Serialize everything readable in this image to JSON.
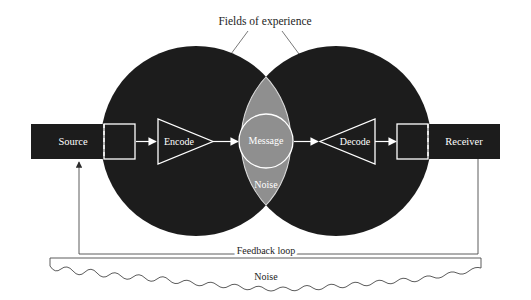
{
  "diagram": {
    "colors": {
      "background": "#ffffff",
      "field_circle": "#1c1c1c",
      "overlap_lens": "#8f8f8f",
      "message_circle": "#8f8f8f",
      "stroke_light": "#ffffff",
      "stroke_dark": "#3a3a3a",
      "text_dark": "#1d1d1d",
      "text_light": "#ffffff"
    },
    "labels": {
      "fields_of_experience": "Fields of experience",
      "source": "Source",
      "encode": "Encode",
      "message": "Message",
      "noise_center": "Noise",
      "decode": "Decode",
      "receiver": "Receiver",
      "feedback_loop": "Feedback loop",
      "noise_band": "Noise"
    },
    "elements": [
      {
        "name": "source-block",
        "label": "Source",
        "kind": "bar"
      },
      {
        "name": "encode-triangle",
        "label": "Encode",
        "kind": "triangle-right"
      },
      {
        "name": "message-circle",
        "label": "Message",
        "kind": "circle"
      },
      {
        "name": "noise-lens-label",
        "label": "Noise",
        "kind": "text"
      },
      {
        "name": "decode-triangle",
        "label": "Decode",
        "kind": "triangle-left"
      },
      {
        "name": "receiver-block",
        "label": "Receiver",
        "kind": "bar"
      }
    ],
    "flow": [
      "Source",
      "Encode",
      "Message",
      "Decode",
      "Receiver"
    ]
  }
}
